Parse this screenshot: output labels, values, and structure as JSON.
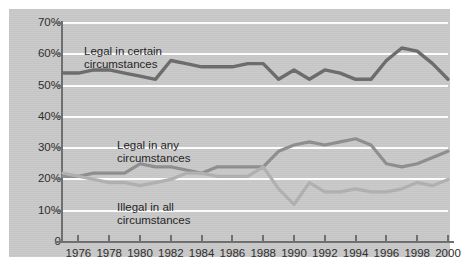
{
  "chart_data": {
    "type": "line",
    "title": "",
    "xlabel": "",
    "ylabel": "",
    "xlim": [
      1975,
      2000
    ],
    "ylim": [
      0,
      70
    ],
    "grid": true,
    "gridlines_y": [
      10,
      20,
      30,
      40,
      50,
      60,
      70
    ],
    "y_ticks": [
      "0",
      "10%",
      "20%",
      "30%",
      "40%",
      "50%",
      "60%",
      "70%"
    ],
    "y_tick_values": [
      0,
      10,
      20,
      30,
      40,
      50,
      60,
      70
    ],
    "x_ticks": [
      "1976",
      "1978",
      "1980",
      "1982",
      "1984",
      "1986",
      "1988",
      "1990",
      "1992",
      "1994",
      "1996",
      "1998",
      "2000"
    ],
    "x_tick_values": [
      1976,
      1978,
      1980,
      1982,
      1984,
      1986,
      1988,
      1990,
      1992,
      1994,
      1996,
      1998,
      2000
    ],
    "legend_position": "inline-annotations",
    "x": [
      1975,
      1976,
      1977,
      1978,
      1979,
      1980,
      1981,
      1982,
      1983,
      1984,
      1985,
      1986,
      1987,
      1988,
      1989,
      1990,
      1991,
      1992,
      1993,
      1994,
      1995,
      1996,
      1997,
      1998,
      1999,
      2000
    ],
    "series": [
      {
        "name": "Legal in certain circumstances",
        "color": "#6b6b6b",
        "values": [
          54,
          54,
          55,
          55,
          54,
          53,
          52,
          58,
          57,
          56,
          56,
          56,
          57,
          57,
          52,
          55,
          52,
          55,
          54,
          52,
          52,
          58,
          62,
          61,
          57,
          52
        ]
      },
      {
        "name": "Legal in any circumstances",
        "color": "#8e8e8e",
        "values": [
          21,
          21,
          22,
          22,
          22,
          25,
          24,
          24,
          23,
          22,
          24,
          24,
          24,
          24,
          29,
          31,
          32,
          31,
          32,
          33,
          31,
          25,
          24,
          25,
          27,
          29
        ]
      },
      {
        "name": "Illegal in all circumstances",
        "color": "#b0b0b0",
        "values": [
          22,
          21,
          20,
          19,
          19,
          18,
          19,
          20,
          22,
          22,
          21,
          21,
          21,
          24,
          17,
          12,
          19,
          16,
          16,
          17,
          16,
          16,
          17,
          19,
          18,
          20
        ]
      }
    ],
    "annotations": [
      {
        "text_line1": "Legal in certain",
        "text_line2": "circumstances"
      },
      {
        "text_line1": "Legal in any",
        "text_line2": "circumstances"
      },
      {
        "text_line1": "Illegal in all",
        "text_line2": "circumstances"
      }
    ]
  },
  "labels": {
    "certain_l1": "Legal in certain",
    "certain_l2": "circumstances",
    "any_l1": "Legal in any",
    "any_l2": "circumstances",
    "illegal_l1": "Illegal in all",
    "illegal_l2": "circumstances"
  },
  "colors": {
    "panel_background": "#c9c9c9",
    "page_background": "#ffffff",
    "gridline": "#ffffff",
    "axis": "#6e6e6e",
    "series_certain": "#6b6b6b",
    "series_any": "#8e8e8e",
    "series_illegal": "#b0b0b0",
    "text": "#1d1d1d"
  }
}
